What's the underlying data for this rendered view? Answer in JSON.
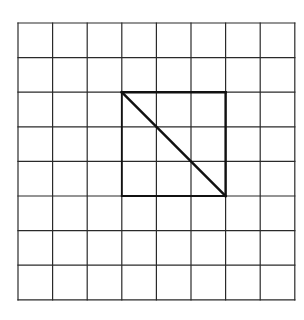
{
  "diagram": {
    "grid": {
      "columns": 8,
      "rows": 8,
      "origin_x": 18,
      "origin_y": 23,
      "cell_size": 34.6,
      "line_color": "#2a2a2a",
      "line_width": 1.2
    },
    "shape": {
      "type": "square-with-diagonal",
      "top_left_cell": [
        3,
        2
      ],
      "size_cells": 3,
      "bold_color": "#111111",
      "bold_width": 2.4,
      "diagonal": "top-left to bottom-right"
    }
  }
}
